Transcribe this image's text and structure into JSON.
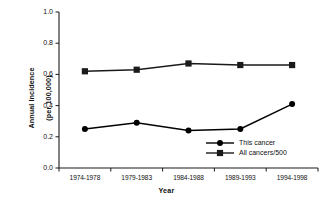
{
  "chart_data": {
    "type": "line",
    "title": "",
    "xlabel": "Year",
    "ylabel": "Annual Incidence\n(per 100,000)",
    "categories": [
      "1974-1978",
      "1979-1983",
      "1984-1988",
      "1989-1993",
      "1994-1998"
    ],
    "ylim": [
      0.0,
      1.0
    ],
    "yticks": [
      "0.0",
      "0.2",
      "0.4",
      "0.6",
      "0.8",
      "1.0"
    ],
    "ytick_values": [
      0.0,
      0.2,
      0.4,
      0.6,
      0.8,
      1.0
    ],
    "grid": false,
    "legend_position": "inside-lower-right",
    "series": [
      {
        "name": "This cancer",
        "marker": "circle",
        "color": "#000000",
        "values": [
          0.25,
          0.29,
          0.24,
          0.25,
          0.41
        ]
      },
      {
        "name": "All cancers/500",
        "marker": "square",
        "color": "#1a1a1a",
        "values": [
          0.62,
          0.63,
          0.67,
          0.66,
          0.66
        ]
      }
    ]
  },
  "axis": {
    "y_label_line1": "Annual Incidence",
    "y_label_line2": "(per 100,000)",
    "x_label": "Year"
  },
  "colors": {
    "axis": "#1a1a1a",
    "series_this_cancer": "#000000",
    "series_all_cancers": "#1a1a1a",
    "background": "#ffffff"
  }
}
